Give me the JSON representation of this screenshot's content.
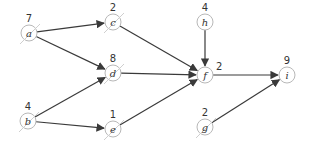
{
  "diagram": {
    "type": "directed-graph",
    "nodes": [
      {
        "id": "a",
        "label": "a",
        "weight": "7",
        "x": 29,
        "y": 33,
        "slashed": true
      },
      {
        "id": "b",
        "label": "b",
        "weight": "4",
        "x": 28,
        "y": 121,
        "slashed": true
      },
      {
        "id": "c",
        "label": "c",
        "weight": "2",
        "x": 113,
        "y": 22,
        "slashed": true
      },
      {
        "id": "d",
        "label": "d",
        "weight": "8",
        "x": 113,
        "y": 73,
        "slashed": true
      },
      {
        "id": "e",
        "label": "e",
        "weight": "1",
        "x": 113,
        "y": 129,
        "slashed": true
      },
      {
        "id": "f",
        "label": "f",
        "weight": "2",
        "x": 205,
        "y": 75,
        "slashed": false
      },
      {
        "id": "g",
        "label": "g",
        "weight": "2",
        "x": 205,
        "y": 127,
        "slashed": true
      },
      {
        "id": "h",
        "label": "h",
        "weight": "4",
        "x": 205,
        "y": 22,
        "slashed": false
      },
      {
        "id": "i",
        "label": "i",
        "weight": "9",
        "x": 287,
        "y": 75,
        "slashed": false
      }
    ],
    "edges": [
      {
        "from": "a",
        "to": "c"
      },
      {
        "from": "a",
        "to": "d"
      },
      {
        "from": "b",
        "to": "d"
      },
      {
        "from": "b",
        "to": "e"
      },
      {
        "from": "c",
        "to": "f"
      },
      {
        "from": "d",
        "to": "f"
      },
      {
        "from": "e",
        "to": "f"
      },
      {
        "from": "h",
        "to": "f"
      },
      {
        "from": "f",
        "to": "i"
      },
      {
        "from": "g",
        "to": "i"
      }
    ],
    "colors": {
      "edge": "#3a3a3a",
      "node_stroke": "#b8b8b8",
      "slash": "#cfcfcf",
      "text": "#333333"
    }
  }
}
